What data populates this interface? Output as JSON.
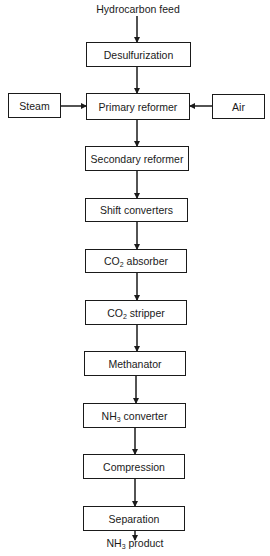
{
  "diagram": {
    "type": "process flow diagram",
    "input_label": "Hydrocarbon feed",
    "output_label": {
      "prefix": "NH",
      "sub": "3",
      "suffix": " product"
    },
    "side_inputs": [
      {
        "id": "steam",
        "label": "Steam",
        "enters": "primary_reformer",
        "side": "left"
      },
      {
        "id": "air",
        "label": "Air",
        "enters": "primary_reformer",
        "side": "right"
      }
    ],
    "steps": [
      {
        "id": "desulfurization",
        "prefix": "Desulfurization",
        "sub": "",
        "suffix": ""
      },
      {
        "id": "primary_reformer",
        "prefix": "Primary reformer",
        "sub": "",
        "suffix": ""
      },
      {
        "id": "secondary_reformer",
        "prefix": "Secondary reformer",
        "sub": "",
        "suffix": ""
      },
      {
        "id": "shift_converters",
        "prefix": "Shift converters",
        "sub": "",
        "suffix": ""
      },
      {
        "id": "co2_absorber",
        "prefix": "CO",
        "sub": "2",
        "suffix": " absorber"
      },
      {
        "id": "co2_stripper",
        "prefix": "CO",
        "sub": "2",
        "suffix": " stripper"
      },
      {
        "id": "methanator",
        "prefix": "Methanator",
        "sub": "",
        "suffix": ""
      },
      {
        "id": "nh3_converter",
        "prefix": "NH",
        "sub": "3",
        "suffix": " converter"
      },
      {
        "id": "compression",
        "prefix": "Compression",
        "sub": "",
        "suffix": ""
      },
      {
        "id": "separation",
        "prefix": "Separation",
        "sub": "",
        "suffix": ""
      }
    ],
    "edges": [
      [
        "hydrocarbon_feed",
        "desulfurization"
      ],
      [
        "desulfurization",
        "primary_reformer"
      ],
      [
        "steam",
        "primary_reformer"
      ],
      [
        "air",
        "primary_reformer"
      ],
      [
        "primary_reformer",
        "secondary_reformer"
      ],
      [
        "secondary_reformer",
        "shift_converters"
      ],
      [
        "shift_converters",
        "co2_absorber"
      ],
      [
        "co2_absorber",
        "co2_stripper"
      ],
      [
        "co2_stripper",
        "methanator"
      ],
      [
        "methanator",
        "nh3_converter"
      ],
      [
        "nh3_converter",
        "compression"
      ],
      [
        "compression",
        "separation"
      ],
      [
        "separation",
        "nh3_product"
      ]
    ]
  }
}
